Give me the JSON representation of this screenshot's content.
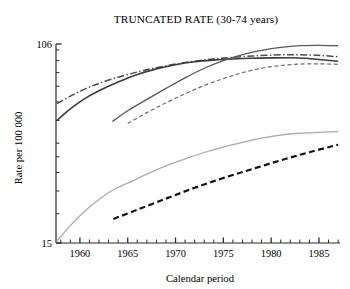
{
  "chart_data": {
    "type": "line",
    "title": "TRUNCATED RATE (30-74 years)",
    "xlabel": "Calendar period",
    "ylabel": "Rate per 100 000",
    "yscale": "log",
    "ylim": [
      15,
      106
    ],
    "xlim": [
      1957.5,
      1987.2
    ],
    "ytick_labels": [
      "106",
      "15"
    ],
    "ytick_values": [
      106,
      15
    ],
    "xtick_labels": [
      "1960",
      "1965",
      "1970",
      "1975",
      "1980",
      "1985"
    ],
    "xtick_values": [
      1960,
      1965,
      1970,
      1975,
      1980,
      1985
    ],
    "x_minor_tick_step": 1,
    "grid": false,
    "legend": "none",
    "series": [
      {
        "name": "series-1-dashdot-upper",
        "style": "dashdot",
        "color": "#4a4a4a",
        "width": 1.5,
        "points": [
          [
            1957.6,
            59.0
          ],
          [
            1959.0,
            63.5
          ],
          [
            1960.5,
            68.0
          ],
          [
            1962.0,
            72.0
          ],
          [
            1964.0,
            76.5
          ],
          [
            1966.0,
            80.5
          ],
          [
            1968.0,
            84.0
          ],
          [
            1970.0,
            87.0
          ],
          [
            1972.0,
            89.5
          ],
          [
            1974.0,
            91.5
          ],
          [
            1976.0,
            93.0
          ],
          [
            1978.0,
            94.2
          ],
          [
            1980.0,
            95.0
          ],
          [
            1982.0,
            95.4
          ],
          [
            1984.0,
            95.2
          ],
          [
            1985.5,
            94.5
          ],
          [
            1987.0,
            93.5
          ]
        ]
      },
      {
        "name": "series-2-solid-dark-early",
        "style": "solid",
        "color": "#3c3c3c",
        "width": 1.6,
        "points": [
          [
            1957.6,
            50.0
          ],
          [
            1959.0,
            56.0
          ],
          [
            1960.5,
            62.0
          ],
          [
            1962.0,
            67.0
          ],
          [
            1964.0,
            73.0
          ],
          [
            1966.0,
            78.5
          ],
          [
            1968.0,
            83.0
          ],
          [
            1970.0,
            86.5
          ],
          [
            1972.0,
            89.0
          ],
          [
            1974.0,
            90.5
          ],
          [
            1976.0,
            91.5
          ],
          [
            1978.0,
            92.2
          ],
          [
            1980.0,
            92.5
          ],
          [
            1982.0,
            92.6
          ],
          [
            1983.5,
            92.2
          ],
          [
            1985.0,
            91.0
          ],
          [
            1987.0,
            89.5
          ]
        ]
      },
      {
        "name": "series-3-solid-dark-mid",
        "style": "solid",
        "color": "#585858",
        "width": 1.3,
        "points": [
          [
            1963.4,
            49.5
          ],
          [
            1965.0,
            55.0
          ],
          [
            1967.0,
            61.5
          ],
          [
            1969.0,
            68.5
          ],
          [
            1971.0,
            76.0
          ],
          [
            1973.0,
            83.5
          ],
          [
            1975.0,
            90.0
          ],
          [
            1977.0,
            95.5
          ],
          [
            1979.0,
            99.5
          ],
          [
            1981.0,
            102.5
          ],
          [
            1983.0,
            104.3
          ],
          [
            1985.0,
            104.6
          ],
          [
            1987.0,
            104.2
          ]
        ]
      },
      {
        "name": "series-4-dashed-thin",
        "style": "dashed-thin",
        "color": "#6a6a6a",
        "width": 1.2,
        "points": [
          [
            1965.0,
            48.5
          ],
          [
            1967.0,
            54.0
          ],
          [
            1969.0,
            59.5
          ],
          [
            1971.0,
            65.0
          ],
          [
            1973.0,
            70.5
          ],
          [
            1975.0,
            75.5
          ],
          [
            1977.0,
            80.0
          ],
          [
            1979.0,
            83.5
          ],
          [
            1981.0,
            85.8
          ],
          [
            1983.0,
            87.0
          ],
          [
            1985.0,
            87.2
          ],
          [
            1987.0,
            86.8
          ]
        ]
      },
      {
        "name": "series-5-solid-light",
        "style": "solid",
        "color": "#a9a9a9",
        "width": 1.3,
        "points": [
          [
            1957.6,
            15.3
          ],
          [
            1959.0,
            17.8
          ],
          [
            1960.5,
            20.5
          ],
          [
            1962.0,
            23.0
          ],
          [
            1963.5,
            25.3
          ],
          [
            1965.0,
            27.0
          ],
          [
            1967.0,
            29.5
          ],
          [
            1969.0,
            32.0
          ],
          [
            1971.0,
            34.3
          ],
          [
            1973.0,
            36.5
          ],
          [
            1975.0,
            38.5
          ],
          [
            1977.0,
            40.3
          ],
          [
            1979.0,
            42.0
          ],
          [
            1981.0,
            43.3
          ],
          [
            1982.5,
            44.0
          ],
          [
            1985.0,
            44.5
          ],
          [
            1987.0,
            44.8
          ]
        ]
      },
      {
        "name": "series-6-dashed-bold-black",
        "style": "dashed-bold",
        "color": "#111111",
        "width": 2.2,
        "points": [
          [
            1963.5,
            19.0
          ],
          [
            1966.0,
            20.8
          ],
          [
            1969.0,
            23.2
          ],
          [
            1972.0,
            25.8
          ],
          [
            1975.0,
            28.4
          ],
          [
            1978.0,
            31.0
          ],
          [
            1981.0,
            33.8
          ],
          [
            1984.0,
            36.6
          ],
          [
            1987.0,
            39.4
          ]
        ]
      }
    ]
  },
  "colors": {
    "axis": "#2a2a2a",
    "text": "#1a1a1a",
    "background": "#ffffff"
  }
}
